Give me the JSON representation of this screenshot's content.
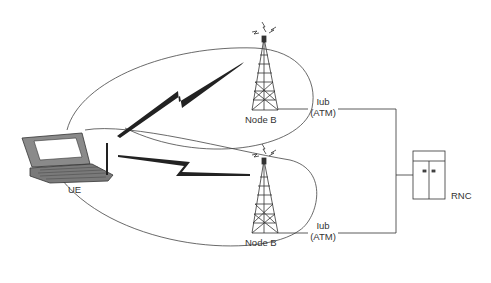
{
  "diagram": {
    "type": "network-architecture",
    "nodes": {
      "ue": {
        "label": "UE"
      },
      "node_b_top": {
        "label": "Node B"
      },
      "node_b_bottom": {
        "label": "Node B"
      },
      "rnc": {
        "label": "RNC"
      }
    },
    "links": {
      "iub_top": {
        "line1": "Iub",
        "line2": "(ATM)"
      },
      "iub_bottom": {
        "line1": "Iub",
        "line2": "(ATM)"
      }
    },
    "radio_links": [
      {
        "from": "UE",
        "to": "Node B (top)"
      },
      {
        "from": "UE",
        "to": "Node B (bottom)"
      }
    ],
    "coverage_areas": 2
  },
  "colors": {
    "line": "#333333",
    "laptop_body": "#8a8a8a",
    "laptop_screen": "#ffffff",
    "bolt": "#222222"
  }
}
